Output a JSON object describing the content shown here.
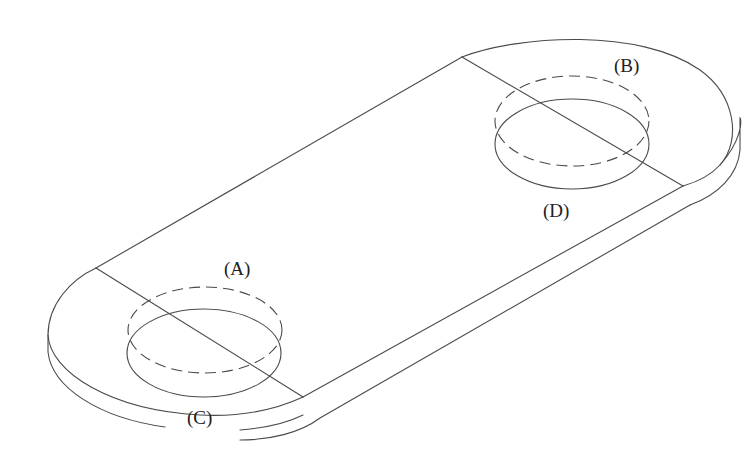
{
  "figure": {
    "type": "isometric-technical-drawing",
    "colors": {
      "background": "#ffffff",
      "line": "#4a4a4a",
      "text": "#222222"
    },
    "labels": {
      "A": "(A)",
      "B": "(B)",
      "C": "(C)",
      "D": "(D)"
    },
    "holes": [
      {
        "id": "left-hole",
        "top_edge_label": "(A)",
        "bottom_edge_label": "(C)"
      },
      {
        "id": "right-hole",
        "top_edge_label": "(B)",
        "bottom_edge_label": "(D)"
      }
    ]
  }
}
